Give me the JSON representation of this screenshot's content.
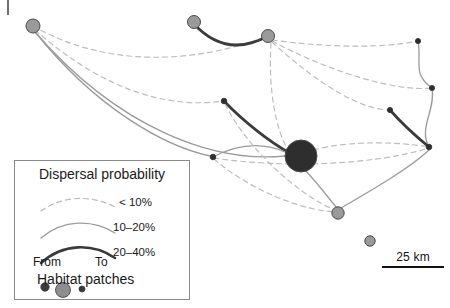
{
  "figure": {
    "type": "habitat-network-map",
    "corner_tick": "|"
  },
  "legend": {
    "title": "Dispersal probability",
    "classes": [
      {
        "label": "< 10%",
        "style": "dashed",
        "color": "#b9b9b9",
        "width": 1.2
      },
      {
        "label": "10–20%",
        "style": "solid-thin",
        "color": "#9a9a9a",
        "width": 1.3
      },
      {
        "label": "20–40%",
        "style": "solid-thick",
        "color": "#3a3a3a",
        "width": 2.6
      }
    ],
    "direction_from": "From",
    "direction_to": "To",
    "patches_title": "Habitat patches",
    "patch_sizes": [
      {
        "r": 4.2,
        "color": "#3a3a3a"
      },
      {
        "r": 7.5,
        "color": "#8e8e8e"
      },
      {
        "r": 3.0,
        "color": "#3a3a3a"
      }
    ]
  },
  "scale": {
    "label": "25 km",
    "length_px": 62
  },
  "colors": {
    "dashed": "#bdbdbd",
    "thin": "#9b9b9b",
    "thick": "#3b3b3b",
    "node_gray": "#9a9a9a",
    "node_dark": "#2e2e2e",
    "node_stroke": "#4a4a4a",
    "legend_border": "#8a8a8a"
  },
  "chart_data": {
    "type": "scatter",
    "xlabel": "",
    "ylabel": "",
    "nodes": [
      {
        "id": "A",
        "x": 33,
        "y": 26,
        "r": 7.0,
        "fill": "#9a9a9a"
      },
      {
        "id": "B",
        "x": 194,
        "y": 22,
        "r": 6.5,
        "fill": "#9a9a9a"
      },
      {
        "id": "C",
        "x": 268,
        "y": 36,
        "r": 6.5,
        "fill": "#9a9a9a"
      },
      {
        "id": "D",
        "x": 418,
        "y": 41,
        "r": 2.6,
        "fill": "#2e2e2e"
      },
      {
        "id": "E",
        "x": 432,
        "y": 88,
        "r": 2.6,
        "fill": "#2e2e2e"
      },
      {
        "id": "F",
        "x": 224,
        "y": 101,
        "r": 2.8,
        "fill": "#2e2e2e"
      },
      {
        "id": "G",
        "x": 390,
        "y": 110,
        "r": 2.6,
        "fill": "#2e2e2e"
      },
      {
        "id": "H",
        "x": 429,
        "y": 147,
        "r": 2.8,
        "fill": "#2e2e2e"
      },
      {
        "id": "I",
        "x": 301,
        "y": 156,
        "r": 16.0,
        "fill": "#2e2e2e"
      },
      {
        "id": "J",
        "x": 213,
        "y": 157,
        "r": 2.8,
        "fill": "#2e2e2e"
      },
      {
        "id": "K",
        "x": 338,
        "y": 213,
        "r": 6.2,
        "fill": "#9a9a9a"
      },
      {
        "id": "L",
        "x": 370,
        "y": 241,
        "r": 5.2,
        "fill": "#9a9a9a"
      }
    ],
    "edges": [
      {
        "from": "A",
        "to": "C",
        "class": "< 10%",
        "path": "M33,26 C110,70 200,62 268,36"
      },
      {
        "from": "A",
        "to": "F",
        "class": "< 10%",
        "path": "M35,30 C110,96 175,108 224,101"
      },
      {
        "from": "A",
        "to": "I",
        "class": "10–20%",
        "path": "M35,32 C120,130 215,163 285,156"
      },
      {
        "from": "B",
        "to": "C",
        "class": "20–40%",
        "path": "M194,24 C220,52 246,48 268,36"
      },
      {
        "from": "C",
        "to": "D",
        "class": "< 10%",
        "path": "M272,40 C330,48 385,48 418,41"
      },
      {
        "from": "C",
        "to": "E",
        "class": "< 10%",
        "path": "M272,41 C330,72 396,92 432,88"
      },
      {
        "from": "C",
        "to": "G",
        "class": "< 10%",
        "path": "M272,42 C320,86 362,110 390,110"
      },
      {
        "from": "D",
        "to": "E",
        "class": "10–20%",
        "path": "M418,41 C422,62 412,74 432,88"
      },
      {
        "from": "E",
        "to": "H",
        "class": "10–20%",
        "path": "M432,88 C436,110 418,128 429,147"
      },
      {
        "from": "G",
        "to": "H",
        "class": "20–40%",
        "path": "M390,110 C404,126 418,138 429,147"
      },
      {
        "from": "F",
        "to": "I",
        "class": "20–40%",
        "path": "M224,101 C244,122 270,142 288,152"
      },
      {
        "from": "J",
        "to": "I",
        "class": "10–20%",
        "path": "M213,157 C238,144 262,142 285,152"
      },
      {
        "from": "J",
        "to": "H",
        "class": "< 10%",
        "path": "M214,158 C280,168 370,166 429,148"
      },
      {
        "from": "J",
        "to": "K",
        "class": "< 10%",
        "path": "M214,159 C250,190 300,210 336,212"
      },
      {
        "from": "I",
        "to": "K",
        "class": "10–20%",
        "path": "M305,170 C320,186 330,200 337,208"
      },
      {
        "from": "I",
        "to": "H",
        "class": "< 10%",
        "path": "M314,150 C350,140 400,142 429,147"
      },
      {
        "from": "K",
        "to": "H",
        "class": "10–20%",
        "path": "M341,208 C372,190 410,168 429,150"
      },
      {
        "from": "A",
        "to": "J",
        "class": "10–20%",
        "path": "M36,33 C96,108 164,146 210,156"
      },
      {
        "from": "F",
        "to": "K",
        "class": "< 10%",
        "path": "M225,104 C248,150 300,196 335,210"
      },
      {
        "from": "C",
        "to": "I",
        "class": "< 10%",
        "path": "M271,43 C268,90 276,130 288,150"
      }
    ],
    "legend": {
      "position": "bottom-left",
      "entries": [
        "< 10%",
        "10–20%",
        "20–40%"
      ]
    },
    "scale_bar": {
      "label": "25 km"
    },
    "grid": false
  }
}
